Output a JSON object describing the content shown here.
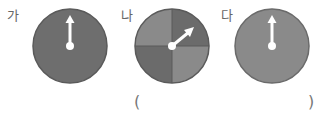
{
  "spinners": [
    {
      "label": "가",
      "type": "single",
      "color": "#6e6e6e",
      "arrow_angle_deg": 0
    },
    {
      "label": "나",
      "type": "quadrants",
      "colors": [
        "#8a8a8a",
        "#6b6b6b",
        "#8a8a8a",
        "#6b6b6b"
      ],
      "arrow_angle_deg": 50
    },
    {
      "label": "다",
      "type": "single",
      "color": "#8a8a8a",
      "arrow_angle_deg": 0
    }
  ],
  "answer": {
    "open": "(",
    "close": ")"
  }
}
